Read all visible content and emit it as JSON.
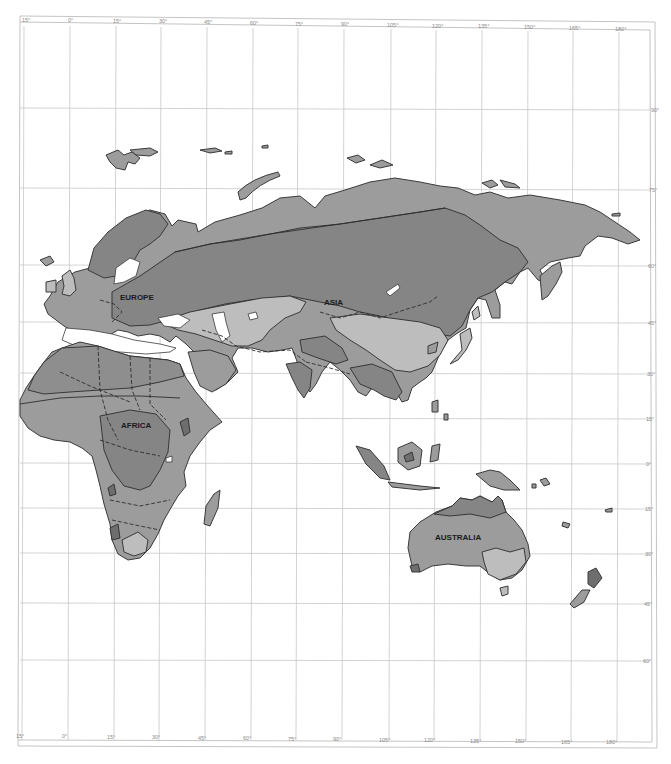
{
  "map": {
    "type": "physical-zones-map",
    "region": "Eastern Hemisphere (Eurasia, Africa, Australia)",
    "colors": {
      "background": "#ffffff",
      "grid": "#c8c8c8",
      "land_light": "#bdbdbd",
      "land_mid": "#9c9c9c",
      "land_dark": "#858585",
      "land_darkest": "#6e6e6e",
      "outline": "#3a3a3a"
    },
    "continent_labels": [
      {
        "id": "europe",
        "text": "EUROPE"
      },
      {
        "id": "asia",
        "text": "ASIA"
      },
      {
        "id": "africa",
        "text": "AFRICA"
      },
      {
        "id": "australia",
        "text": "AUSTRALIA"
      }
    ],
    "longitude_labels_top": [
      "15°",
      "0°",
      "15°",
      "30°",
      "45°",
      "60°",
      "75°",
      "90°",
      "105°",
      "120°",
      "135°",
      "150°",
      "165°",
      "180°"
    ],
    "longitude_labels_bottom": [
      "15°",
      "0°",
      "15°",
      "30°",
      "45°",
      "60°",
      "75°",
      "90°",
      "105°",
      "120°",
      "135°",
      "150°",
      "165°",
      "180°"
    ],
    "latitude_labels_right": [
      "90°",
      "75°",
      "60°",
      "45°",
      "30°",
      "15°",
      "0°",
      "15°",
      "30°",
      "45°",
      "60°"
    ]
  }
}
